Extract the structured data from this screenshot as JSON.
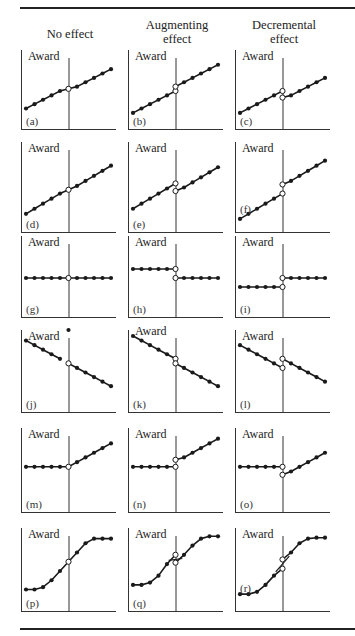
{
  "figure": {
    "column_headers": [
      "No effect",
      "Augmenting\neffect",
      "Decremental\neffect"
    ],
    "y_axis_label": "Award",
    "colors": {
      "line": "#1a1a1a",
      "open_marker_fill": "#ffffff",
      "axis": "#333333"
    }
  },
  "chart_data": {
    "type": "line",
    "title": "",
    "x_cutoff": 5,
    "columns": [
      "No effect",
      "Augmenting effect",
      "Decremental effect"
    ],
    "panels": [
      {
        "label": "(a)",
        "column": "No effect",
        "shape": "linear increasing",
        "left": {
          "x": [
            0,
            1,
            2,
            3,
            4
          ],
          "y": [
            1,
            2,
            3,
            4,
            5
          ]
        },
        "right": {
          "x": [
            6,
            7,
            8,
            9,
            10
          ],
          "y": [
            6,
            7,
            8,
            9,
            10
          ]
        },
        "cut_open": [
          5.5
        ],
        "ylim": [
          -3,
          13
        ]
      },
      {
        "label": "(b)",
        "column": "Augmenting effect",
        "shape": "linear increasing, upward jump",
        "left": {
          "x": [
            0,
            1,
            2,
            3,
            4
          ],
          "y": [
            0,
            1,
            2,
            3,
            4
          ]
        },
        "right": {
          "x": [
            6,
            7,
            8,
            9,
            10
          ],
          "y": [
            7,
            8,
            9,
            10,
            11
          ]
        },
        "cut_open": [
          5,
          6
        ],
        "ylim": [
          -3,
          13
        ]
      },
      {
        "label": "(c)",
        "column": "Decremental effect",
        "shape": "linear increasing, downward jump",
        "left": {
          "x": [
            0,
            1,
            2,
            3,
            4
          ],
          "y": [
            0,
            1,
            2,
            3,
            4
          ]
        },
        "right": {
          "x": [
            6,
            7,
            8,
            9,
            10
          ],
          "y": [
            4,
            5,
            6,
            7,
            8
          ]
        },
        "cut_open": [
          5,
          3.5
        ],
        "ylim": [
          -3,
          13
        ]
      },
      {
        "label": "(d)",
        "column": "No effect",
        "shape": "linear increasing",
        "left": {
          "x": [
            0,
            1,
            2,
            3,
            4
          ],
          "y": [
            0,
            1,
            2,
            3,
            4
          ]
        },
        "right": {
          "x": [
            6,
            7,
            8,
            9,
            10
          ],
          "y": [
            5.5,
            6.5,
            7.5,
            8.5,
            9.5
          ]
        },
        "cut_open": [
          4.75
        ],
        "ylim": [
          -3,
          13
        ]
      },
      {
        "label": "(e)",
        "column": "Augmenting effect",
        "shape": "linear increasing, downward jump",
        "left": {
          "x": [
            0,
            1,
            2,
            3,
            4
          ],
          "y": [
            1,
            2,
            3,
            4,
            5
          ]
        },
        "right": {
          "x": [
            6,
            7,
            8,
            9,
            10
          ],
          "y": [
            5.2,
            6.2,
            7.2,
            8.2,
            9.2
          ]
        },
        "cut_open": [
          6,
          4.5
        ],
        "ylim": [
          -3,
          13
        ]
      },
      {
        "label": "(f)",
        "column": "Decremental effect",
        "shape": "linear increasing, upward jump",
        "left": {
          "x": [
            0,
            1,
            2,
            3,
            4
          ],
          "y": [
            -1,
            0,
            1,
            2,
            3
          ]
        },
        "right": {
          "x": [
            6,
            7,
            8,
            9,
            10
          ],
          "y": [
            6.5,
            7.5,
            8.5,
            9.5,
            10.5
          ]
        },
        "cut_open": [
          4,
          5.8
        ],
        "ylim": [
          -3,
          13
        ]
      },
      {
        "label": "(g)",
        "column": "No effect",
        "shape": "flat",
        "left": {
          "x": [
            0,
            1,
            2,
            3,
            4
          ],
          "y": [
            5,
            5,
            5,
            5,
            5
          ]
        },
        "right": {
          "x": [
            6,
            7,
            8,
            9,
            10
          ],
          "y": [
            5,
            5,
            5,
            5,
            5
          ]
        },
        "cut_open": [
          5
        ],
        "ylim": [
          -3,
          13
        ]
      },
      {
        "label": "(h)",
        "column": "Augmenting effect",
        "shape": "flat, downward jump",
        "left": {
          "x": [
            0,
            1,
            2,
            3,
            4
          ],
          "y": [
            7,
            7,
            7,
            7,
            7
          ]
        },
        "right": {
          "x": [
            6,
            7,
            8,
            9,
            10
          ],
          "y": [
            5,
            5,
            5,
            5,
            5
          ]
        },
        "cut_open": [
          7,
          5
        ],
        "ylim": [
          -3,
          13
        ]
      },
      {
        "label": "(i)",
        "column": "Decremental effect",
        "shape": "flat, upward jump",
        "left": {
          "x": [
            0,
            1,
            2,
            3,
            4
          ],
          "y": [
            3,
            3,
            3,
            3,
            3
          ]
        },
        "right": {
          "x": [
            6,
            7,
            8,
            9,
            10
          ],
          "y": [
            5,
            5,
            5,
            5,
            5
          ]
        },
        "cut_open": [
          3,
          5
        ],
        "ylim": [
          -3,
          13
        ]
      },
      {
        "label": "(j)",
        "column": "No effect",
        "shape": "linear decreasing",
        "left": {
          "x": [
            0,
            1,
            2,
            3,
            4,
            5
          ],
          "y": [
            12,
            11,
            10,
            9,
            8
          ]
        },
        "right": {
          "x": [
            6,
            7,
            8,
            9,
            10
          ],
          "y": [
            6,
            5,
            4,
            3,
            2
          ]
        },
        "cut_open": [
          7
        ],
        "ylim": [
          -3,
          13
        ]
      },
      {
        "label": "(k)",
        "column": "Augmenting effect",
        "shape": "linear decreasing, downward jump",
        "left": {
          "x": [
            0,
            1,
            2,
            3,
            4
          ],
          "y": [
            13,
            12,
            11,
            10,
            9
          ]
        },
        "right": {
          "x": [
            6,
            7,
            8,
            9,
            10
          ],
          "y": [
            6,
            5,
            4,
            3,
            2
          ]
        },
        "cut_open": [
          8,
          7
        ],
        "ylim": [
          -3,
          13
        ]
      },
      {
        "label": "(l)",
        "column": "Decremental effect",
        "shape": "linear decreasing, upward jump",
        "left": {
          "x": [
            0,
            1,
            2,
            3,
            4
          ],
          "y": [
            11,
            10,
            9,
            8,
            7
          ]
        },
        "right": {
          "x": [
            6,
            7,
            8,
            9,
            10
          ],
          "y": [
            7,
            6,
            5,
            4,
            3
          ]
        },
        "cut_open": [
          6,
          8
        ],
        "ylim": [
          -3,
          13
        ]
      },
      {
        "label": "(m)",
        "column": "No effect",
        "shape": "flat then increasing",
        "left": {
          "x": [
            0,
            1,
            2,
            3,
            4
          ],
          "y": [
            6,
            6,
            6,
            6,
            6
          ]
        },
        "right": {
          "x": [
            6,
            7,
            8,
            9,
            10
          ],
          "y": [
            7,
            8,
            9,
            10,
            11
          ]
        },
        "cut_open": [
          6
        ],
        "ylim": [
          -3,
          13
        ]
      },
      {
        "label": "(n)",
        "column": "Augmenting effect",
        "shape": "flat then increasing, upward jump",
        "left": {
          "x": [
            0,
            1,
            2,
            3,
            4
          ],
          "y": [
            6,
            6,
            6,
            6,
            6
          ]
        },
        "right": {
          "x": [
            6,
            7,
            8,
            9,
            10
          ],
          "y": [
            8,
            9,
            10,
            11,
            12
          ]
        },
        "cut_open": [
          6,
          7.5
        ],
        "ylim": [
          -3,
          13
        ]
      },
      {
        "label": "(o)",
        "column": "Decremental effect",
        "shape": "flat then increasing, downward jump",
        "left": {
          "x": [
            0,
            1,
            2,
            3,
            4
          ],
          "y": [
            6,
            6,
            6,
            6,
            6
          ]
        },
        "right": {
          "x": [
            6,
            7,
            8,
            9,
            10
          ],
          "y": [
            5,
            6,
            7,
            8,
            9
          ]
        },
        "cut_open": [
          6,
          4.3
        ],
        "ylim": [
          -3,
          13
        ]
      },
      {
        "label": "(p)",
        "column": "No effect",
        "shape": "sigmoid",
        "left": {
          "x": [
            0,
            1,
            2,
            3,
            4
          ],
          "y": [
            1,
            1,
            1.5,
            3,
            5
          ]
        },
        "right": {
          "x": [
            6,
            7,
            8,
            9,
            10
          ],
          "y": [
            9,
            11,
            12,
            12,
            12
          ]
        },
        "cut_open": [
          7
        ],
        "ylim": [
          -3,
          13
        ]
      },
      {
        "label": "(q)",
        "column": "Augmenting effect",
        "shape": "sigmoid, downward jump",
        "left": {
          "x": [
            0,
            1,
            2,
            3,
            4
          ],
          "y": [
            2,
            2,
            2.5,
            4,
            6.5
          ]
        },
        "right": {
          "x": [
            6,
            7,
            8,
            9,
            10
          ],
          "y": [
            8.5,
            10.5,
            12,
            12.5,
            12.5
          ]
        },
        "cut_open": [
          8.5,
          6.8
        ],
        "ylim": [
          -3,
          13
        ]
      },
      {
        "label": "(r)",
        "column": "Decremental effect",
        "shape": "sigmoid, upward jump",
        "left": {
          "x": [
            0,
            1,
            2,
            3,
            4
          ],
          "y": [
            0,
            0,
            0.5,
            2,
            4
          ]
        },
        "right": {
          "x": [
            6,
            7,
            8,
            9,
            10
          ],
          "y": [
            9,
            11,
            12,
            12.2,
            12.2
          ]
        },
        "cut_open": [
          5.5,
          7.5
        ],
        "ylim": [
          -3,
          13
        ]
      }
    ]
  }
}
